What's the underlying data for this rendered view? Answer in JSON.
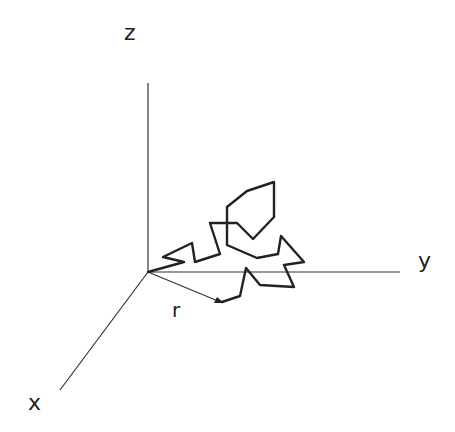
{
  "figure": {
    "type": "3D random walk diagram",
    "axes": {
      "x_label": "x",
      "y_label": "y",
      "z_label": "z"
    },
    "vector_label": "r",
    "colors": {
      "background": "#ffffff",
      "line": "#222222"
    },
    "geometry": {
      "origin": [
        148,
        272
      ],
      "z_axis_end": [
        148,
        83
      ],
      "y_axis_end": [
        400,
        272
      ],
      "x_axis_end": [
        60,
        390
      ],
      "r_vector_end": [
        222,
        302
      ],
      "walk_path": [
        [
          148,
          272
        ],
        [
          184,
          262
        ],
        [
          163,
          257
        ],
        [
          192,
          243
        ],
        [
          195,
          262
        ],
        [
          220,
          254
        ],
        [
          210,
          223
        ],
        [
          237,
          223
        ],
        [
          253,
          239
        ],
        [
          274,
          217
        ],
        [
          274,
          182
        ],
        [
          247,
          191
        ],
        [
          227,
          207
        ],
        [
          227,
          245
        ],
        [
          257,
          258
        ],
        [
          278,
          254
        ],
        [
          281,
          236
        ],
        [
          304,
          262
        ],
        [
          284,
          265
        ],
        [
          294,
          287
        ],
        [
          260,
          285
        ],
        [
          246,
          268
        ],
        [
          240,
          296
        ],
        [
          222,
          302
        ]
      ]
    }
  }
}
